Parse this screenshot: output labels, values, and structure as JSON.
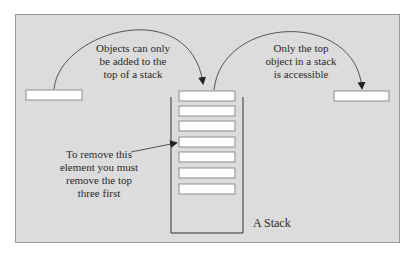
{
  "diagram": {
    "title": "A Stack",
    "annotations": {
      "push": "Objects can only be added to the top of a stack",
      "pop": "Only the top object in a stack is accessible",
      "remove": "To remove this element you must remove the top three first"
    },
    "annotation_lines": {
      "push": [
        "Objects can only",
        "be added to the",
        "top of a stack"
      ],
      "pop": [
        "Only the top",
        "object in a stack",
        "is accessible"
      ],
      "remove": [
        "To remove this",
        "element you must",
        "remove the top",
        "three first"
      ]
    },
    "stack_label": "A Stack",
    "stack_slot_count": 7,
    "colors": {
      "panel": "#dcdcdc",
      "panel_border": "#9a9a9a",
      "box_fill": "#ffffff",
      "box_border": "#8c8c8c",
      "line": "#333333"
    }
  }
}
